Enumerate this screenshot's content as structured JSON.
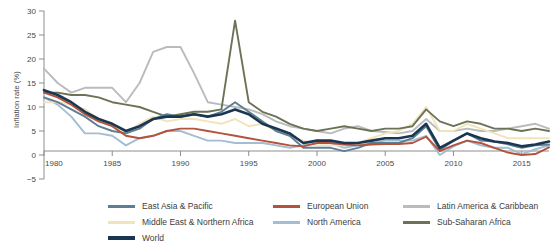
{
  "chart_data": {
    "type": "line",
    "title": "",
    "xlabel": "",
    "ylabel": "Inflation rate (%)",
    "xlim": [
      1980,
      2017
    ],
    "ylim": [
      -5,
      30
    ],
    "ytick_values": [
      -5,
      0,
      5,
      10,
      15,
      20,
      25,
      30
    ],
    "ytick_labels": [
      "−5",
      "0",
      "5",
      "10",
      "15",
      "20",
      "25",
      "30"
    ],
    "xtick_values": [
      1980,
      1985,
      1990,
      1995,
      2000,
      2005,
      2010,
      2015
    ],
    "xtick_labels": [
      "1980",
      "1985",
      "1990",
      "1995",
      "2000",
      "2005",
      "2010",
      "2015"
    ],
    "grid": false,
    "legend_position": "bottom",
    "x": [
      1980,
      1981,
      1982,
      1983,
      1984,
      1985,
      1986,
      1987,
      1988,
      1989,
      1990,
      1991,
      1992,
      1993,
      1994,
      1995,
      1996,
      1997,
      1998,
      1999,
      2000,
      2001,
      2002,
      2003,
      2004,
      2005,
      2006,
      2007,
      2008,
      2009,
      2010,
      2011,
      2012,
      2013,
      2014,
      2015,
      2016,
      2017
    ],
    "series": [
      {
        "name": "East Asia & Pacific",
        "color": "#5d7f93",
        "values": [
          12.0,
          11.0,
          9.5,
          8.0,
          6.0,
          5.0,
          4.5,
          5.5,
          7.5,
          8.5,
          8.0,
          8.5,
          8.0,
          9.0,
          11.0,
          9.0,
          7.0,
          5.0,
          4.0,
          1.5,
          1.5,
          1.5,
          0.8,
          1.5,
          2.5,
          2.5,
          2.5,
          3.5,
          6.0,
          1.0,
          3.0,
          4.5,
          3.0,
          2.8,
          2.2,
          1.5,
          2.0,
          2.2
        ]
      },
      {
        "name": "European Union",
        "color": "#b5523c",
        "values": [
          13.0,
          12.0,
          10.5,
          8.5,
          7.0,
          6.0,
          4.0,
          3.5,
          4.0,
          5.0,
          5.5,
          5.5,
          5.0,
          4.5,
          4.0,
          3.5,
          3.0,
          2.5,
          2.0,
          1.8,
          2.5,
          2.5,
          2.2,
          2.0,
          2.2,
          2.3,
          2.3,
          2.5,
          3.8,
          0.8,
          2.0,
          3.0,
          2.5,
          1.5,
          0.5,
          0.0,
          0.2,
          1.6
        ]
      },
      {
        "name": "Latin America & Caribbean",
        "color": "#b9bbbd",
        "values": [
          18.0,
          15.0,
          13.0,
          14.0,
          14.0,
          14.0,
          11.0,
          15.0,
          21.5,
          22.5,
          22.5,
          17.0,
          11.0,
          10.5,
          10.0,
          9.5,
          8.5,
          7.0,
          6.0,
          5.5,
          5.0,
          4.5,
          5.5,
          6.0,
          5.0,
          4.8,
          4.5,
          5.0,
          7.5,
          5.0,
          5.0,
          5.5,
          5.0,
          5.0,
          5.5,
          6.0,
          6.5,
          5.5
        ]
      },
      {
        "name": "Middle East & Northern Africa",
        "color": "#f2e3bb",
        "values": [
          11.0,
          11.0,
          10.5,
          9.5,
          7.5,
          6.0,
          4.5,
          6.5,
          8.0,
          7.0,
          7.5,
          7.5,
          7.0,
          6.5,
          7.5,
          6.0,
          6.5,
          5.0,
          4.0,
          3.0,
          2.0,
          2.0,
          2.0,
          2.5,
          3.5,
          4.5,
          5.0,
          6.5,
          10.0,
          5.0,
          5.0,
          6.5,
          5.5,
          4.5,
          3.5,
          3.5,
          3.5,
          3.5
        ]
      },
      {
        "name": "North America",
        "color": "#a3bdd1",
        "values": [
          12.0,
          10.5,
          8.0,
          4.5,
          4.5,
          4.0,
          2.0,
          3.5,
          4.0,
          5.0,
          5.0,
          4.0,
          3.0,
          3.0,
          2.5,
          2.5,
          2.5,
          2.0,
          1.5,
          2.0,
          3.0,
          2.5,
          1.5,
          2.0,
          2.5,
          3.0,
          3.0,
          3.0,
          4.0,
          0.0,
          1.8,
          3.0,
          2.0,
          1.5,
          1.5,
          0.2,
          1.2,
          2.0
        ]
      },
      {
        "name": "Sub-Saharan Africa",
        "color": "#6b7356",
        "values": [
          13.0,
          13.0,
          12.5,
          12.5,
          12.0,
          11.0,
          10.5,
          10.0,
          9.0,
          8.0,
          8.5,
          9.0,
          9.0,
          9.5,
          28.0,
          11.0,
          9.0,
          8.0,
          6.5,
          5.5,
          5.0,
          5.5,
          6.0,
          5.5,
          5.0,
          5.5,
          5.5,
          6.0,
          9.5,
          7.0,
          6.0,
          7.0,
          6.5,
          5.5,
          5.5,
          5.0,
          5.5,
          5.0
        ]
      },
      {
        "name": "World",
        "color": "#1b3651",
        "values": [
          13.5,
          12.5,
          11.0,
          9.0,
          7.5,
          6.5,
          5.0,
          6.0,
          7.5,
          8.0,
          8.0,
          8.5,
          8.0,
          8.5,
          9.5,
          8.5,
          6.5,
          5.5,
          4.5,
          2.5,
          3.0,
          3.0,
          2.5,
          2.5,
          3.0,
          3.5,
          3.5,
          4.0,
          6.5,
          1.5,
          3.0,
          4.5,
          3.5,
          2.8,
          2.5,
          1.8,
          2.2,
          2.8
        ]
      }
    ]
  },
  "axis": {
    "ylabel": "Inflation rate (%)"
  },
  "legend": {
    "rows": [
      [
        {
          "label": "East Asia & Pacific",
          "color": "#5d7f93",
          "thick": false
        },
        {
          "label": "European Union",
          "color": "#b5523c",
          "thick": false
        },
        {
          "label": "Latin America & Caribbean",
          "color": "#b9bbbd",
          "thick": false
        }
      ],
      [
        {
          "label": "Middle East & Northern Africa",
          "color": "#f2e3bb",
          "thick": false
        },
        {
          "label": "North America",
          "color": "#a3bdd1",
          "thick": false
        },
        {
          "label": "Sub-Saharan Africa",
          "color": "#6b7356",
          "thick": false
        }
      ],
      [
        {
          "label": "World",
          "color": "#1b3651",
          "thick": true
        }
      ]
    ]
  }
}
